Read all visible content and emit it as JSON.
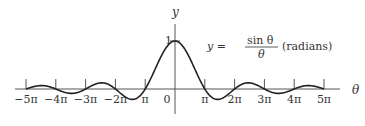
{
  "chart_data": {
    "type": "line",
    "title": "",
    "function": "sin(theta)/theta",
    "annotation": {
      "lhs": "y =",
      "numerator": "sin θ",
      "denominator": "θ",
      "suffix": "(radians)"
    },
    "xlabel": "θ",
    "ylabel": "y",
    "xlim_pi": [
      -5.5,
      5.5
    ],
    "ylim": [
      -0.35,
      1.5
    ],
    "x_ticks": [
      {
        "value_pi": -5,
        "label": "−5π"
      },
      {
        "value_pi": -4,
        "label": "−4π"
      },
      {
        "value_pi": -3,
        "label": "−3π"
      },
      {
        "value_pi": -2,
        "label": "−2π"
      },
      {
        "value_pi": -1,
        "label": "π"
      },
      {
        "value_pi": 0,
        "label": "0"
      },
      {
        "value_pi": 1,
        "label": "π"
      },
      {
        "value_pi": 2,
        "label": "2π"
      },
      {
        "value_pi": 3,
        "label": "3π"
      },
      {
        "value_pi": 4,
        "label": "4π"
      },
      {
        "value_pi": 5,
        "label": "5π"
      }
    ],
    "y_ticks": [
      {
        "value": 1,
        "label": "1"
      }
    ],
    "x_range_pi": [
      -5,
      5
    ],
    "grid": false,
    "legend": "none"
  }
}
